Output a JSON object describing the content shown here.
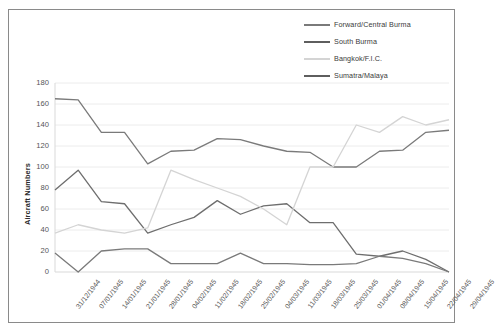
{
  "chart_data": {
    "type": "line",
    "title": "",
    "xlabel": "",
    "ylabel": "Aircraft Numbers",
    "ylim": [
      0,
      180
    ],
    "yticks": [
      0,
      20,
      40,
      60,
      80,
      100,
      120,
      140,
      160,
      180
    ],
    "grid": true,
    "legend_position": "top-right",
    "categories": [
      "31/12/1944",
      "07/01/1945",
      "14/01/1945",
      "21/01/1945",
      "28/01/1945",
      "04/02/1945",
      "11/02/1945",
      "18/02/1945",
      "25/02/1945",
      "04/03/1945",
      "11/03/1945",
      "18/03/1945",
      "25/03/1945",
      "01/04/1945",
      "08/04/1945",
      "15/04/1945",
      "22/04/1945",
      "29/04/1945"
    ],
    "series": [
      {
        "name": "Forward/Central Burma",
        "color": "#7a7a7a",
        "values": [
          165,
          164,
          133,
          133,
          103,
          115,
          116,
          127,
          126,
          120,
          115,
          114,
          100,
          100,
          115,
          116,
          133,
          135
        ]
      },
      {
        "name": "South Burma",
        "color": "#6e6e6e",
        "values": [
          78,
          97,
          67,
          65,
          37,
          45,
          52,
          68,
          55,
          63,
          65,
          47,
          47,
          17,
          15,
          20,
          12,
          0
        ]
      },
      {
        "name": "Bangkok/F.I.C.",
        "color": "#d4d4d4",
        "values": [
          37,
          45,
          40,
          37,
          42,
          97,
          88,
          80,
          72,
          60,
          45,
          100,
          100,
          140,
          133,
          148,
          140,
          145
        ]
      },
      {
        "name": "Sumatra/Malaya",
        "color": "#7a7a7a",
        "values": [
          18,
          0,
          20,
          22,
          22,
          8,
          8,
          8,
          18,
          8,
          8,
          7,
          7,
          8,
          15,
          13,
          8,
          0
        ]
      }
    ]
  },
  "legend": {
    "items": [
      {
        "label": "Forward/Central Burma",
        "color": "#7a7a7a"
      },
      {
        "label": "South Burma",
        "color": "#5e5e5e"
      },
      {
        "label": "Bangkok/F.I.C.",
        "color": "#d4d4d4"
      },
      {
        "label": "Sumatra/Malaya",
        "color": "#5e5e5e"
      }
    ]
  }
}
